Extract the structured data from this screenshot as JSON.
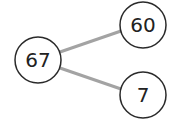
{
  "diagram": {
    "type": "tree",
    "colors": {
      "node_stroke": "#2a2a2a",
      "node_fill": "#ffffff",
      "edge": "#a3a3a3",
      "text": "#222222"
    },
    "nodes": [
      {
        "id": "n67",
        "label": "67",
        "cx": 38,
        "cy": 60,
        "r": 23
      },
      {
        "id": "n60",
        "label": "60",
        "cx": 143,
        "cy": 25,
        "r": 23
      },
      {
        "id": "n7",
        "label": "7",
        "cx": 143,
        "cy": 95,
        "r": 23
      }
    ],
    "edges": [
      {
        "from": "n67",
        "to": "n60"
      },
      {
        "from": "n67",
        "to": "n7"
      }
    ]
  }
}
